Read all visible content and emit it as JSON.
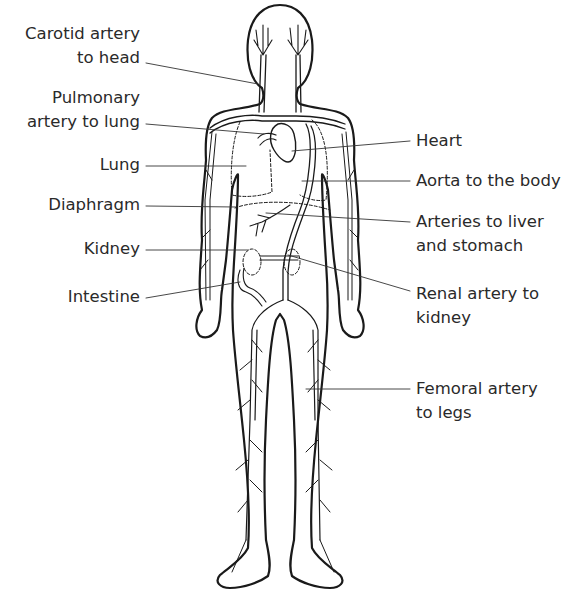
{
  "labels_left": [
    {
      "id": "carotid",
      "lines": [
        "Carotid artery",
        "to head"
      ]
    },
    {
      "id": "pulmonary",
      "lines": [
        "Pulmonary",
        "artery to lung"
      ]
    },
    {
      "id": "lung",
      "lines": [
        "Lung"
      ]
    },
    {
      "id": "diaphragm",
      "lines": [
        "Diaphragm"
      ]
    },
    {
      "id": "kidney",
      "lines": [
        "Kidney"
      ]
    },
    {
      "id": "intestine",
      "lines": [
        "Intestine"
      ]
    }
  ],
  "labels_right": [
    {
      "id": "heart",
      "lines": [
        "Heart"
      ]
    },
    {
      "id": "aorta",
      "lines": [
        "Aorta to the body"
      ]
    },
    {
      "id": "liver-stomach",
      "lines": [
        "Arteries to liver",
        "and stomach"
      ]
    },
    {
      "id": "renal",
      "lines": [
        "Renal artery to",
        "kidney"
      ]
    },
    {
      "id": "femoral",
      "lines": [
        "Femoral artery",
        "to legs"
      ]
    }
  ],
  "colors": {
    "ink": "#1a1a1a",
    "text": "#2a2a2a",
    "background": "#ffffff"
  }
}
